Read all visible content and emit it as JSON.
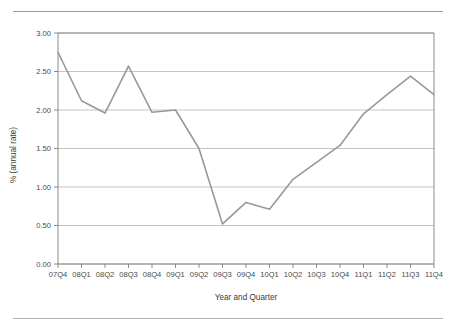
{
  "figure": {
    "has_top_rule": true,
    "has_bottom_rule": true,
    "background_color": "#ffffff",
    "line_color": "#999999",
    "grid_color": "#b5b5b5",
    "axis_color": "#808080",
    "text_color": "#3a3a3a"
  },
  "chart_data": {
    "type": "line",
    "title": "",
    "xlabel": "Year and Quarter",
    "ylabel": "% (annual rate)",
    "categories": [
      "07Q4",
      "08Q1",
      "08Q2",
      "08Q3",
      "08Q4",
      "09Q1",
      "09Q2",
      "09Q3",
      "09Q4",
      "10Q1",
      "10Q2",
      "10Q3",
      "10Q4",
      "11Q1",
      "11Q2",
      "11Q3",
      "11Q4"
    ],
    "values": [
      2.75,
      2.12,
      1.96,
      2.57,
      1.97,
      2.0,
      1.5,
      0.52,
      0.8,
      0.71,
      1.1,
      1.32,
      1.54,
      1.95,
      2.2,
      2.44,
      2.2
    ],
    "ylim": [
      0.0,
      3.0
    ],
    "ytick_labels": [
      "3.00",
      "2.50",
      "2.00",
      "1.50",
      "1.00",
      "0.50",
      "0.00"
    ],
    "ytick_values": [
      3.0,
      2.5,
      2.0,
      1.5,
      1.0,
      0.5,
      0.0
    ],
    "grid": "horizontal",
    "legend": "none",
    "markers": "none"
  }
}
